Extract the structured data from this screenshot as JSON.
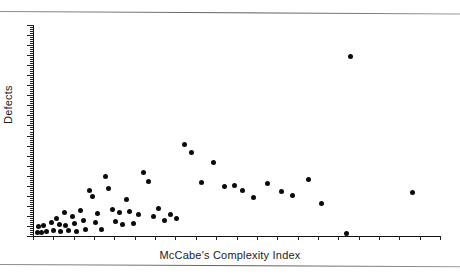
{
  "figure": {
    "background_color": "#ffffff",
    "marker_color": "#0b0b0b",
    "axis_color": "#111111",
    "rule_color": "#6e6e6e"
  },
  "labels": {
    "x_axis": "McCabe's Complexity Index",
    "y_axis": "Defects"
  },
  "chart_data": {
    "type": "scatter",
    "title": "",
    "xlabel": "McCabe's Complexity Index",
    "ylabel": "Defects",
    "grid": false,
    "legend": null,
    "xlim": [
      0,
      21
    ],
    "ylim": [
      0,
      21
    ],
    "x_ticks_count": 21,
    "x_tick_labels": [],
    "y_tick_labels": [],
    "note": "Unlabeled tick marks on both axes; values are read in tick units.",
    "points": [
      {
        "x": 0.25,
        "y": 0.35
      },
      {
        "x": 0.3,
        "y": 0.95
      },
      {
        "x": 0.45,
        "y": 0.3
      },
      {
        "x": 0.55,
        "y": 1.0
      },
      {
        "x": 0.7,
        "y": 0.4
      },
      {
        "x": 0.95,
        "y": 1.35
      },
      {
        "x": 1.05,
        "y": 0.55
      },
      {
        "x": 1.2,
        "y": 1.75
      },
      {
        "x": 1.35,
        "y": 1.15
      },
      {
        "x": 1.4,
        "y": 0.45
      },
      {
        "x": 1.6,
        "y": 2.35
      },
      {
        "x": 1.7,
        "y": 1.05
      },
      {
        "x": 1.85,
        "y": 0.5
      },
      {
        "x": 2.05,
        "y": 1.95
      },
      {
        "x": 2.15,
        "y": 1.25
      },
      {
        "x": 2.25,
        "y": 0.4
      },
      {
        "x": 2.45,
        "y": 2.55
      },
      {
        "x": 2.6,
        "y": 1.5
      },
      {
        "x": 2.7,
        "y": 0.6
      },
      {
        "x": 2.9,
        "y": 4.55
      },
      {
        "x": 3.05,
        "y": 3.95
      },
      {
        "x": 3.2,
        "y": 1.3
      },
      {
        "x": 3.35,
        "y": 2.2
      },
      {
        "x": 3.55,
        "y": 0.65
      },
      {
        "x": 3.75,
        "y": 5.95
      },
      {
        "x": 3.9,
        "y": 4.7
      },
      {
        "x": 4.1,
        "y": 2.6
      },
      {
        "x": 4.25,
        "y": 1.4
      },
      {
        "x": 4.45,
        "y": 2.3
      },
      {
        "x": 4.6,
        "y": 1.1
      },
      {
        "x": 4.8,
        "y": 3.6
      },
      {
        "x": 5.0,
        "y": 2.45
      },
      {
        "x": 5.2,
        "y": 1.2
      },
      {
        "x": 5.45,
        "y": 2.15
      },
      {
        "x": 5.7,
        "y": 6.3
      },
      {
        "x": 5.95,
        "y": 5.4
      },
      {
        "x": 6.2,
        "y": 1.95
      },
      {
        "x": 6.5,
        "y": 2.7
      },
      {
        "x": 6.8,
        "y": 1.55
      },
      {
        "x": 7.1,
        "y": 2.1
      },
      {
        "x": 7.4,
        "y": 1.7
      },
      {
        "x": 7.8,
        "y": 9.1
      },
      {
        "x": 8.2,
        "y": 8.35
      },
      {
        "x": 8.7,
        "y": 5.3
      },
      {
        "x": 9.3,
        "y": 7.35
      },
      {
        "x": 9.9,
        "y": 4.9
      },
      {
        "x": 10.4,
        "y": 5.05
      },
      {
        "x": 10.8,
        "y": 4.55
      },
      {
        "x": 11.4,
        "y": 3.85
      },
      {
        "x": 12.1,
        "y": 5.25
      },
      {
        "x": 12.8,
        "y": 4.4
      },
      {
        "x": 13.4,
        "y": 4.05
      },
      {
        "x": 14.2,
        "y": 5.6
      },
      {
        "x": 14.9,
        "y": 3.25
      },
      {
        "x": 16.4,
        "y": 17.9
      },
      {
        "x": 16.2,
        "y": 0.25
      },
      {
        "x": 19.6,
        "y": 4.35
      }
    ]
  }
}
